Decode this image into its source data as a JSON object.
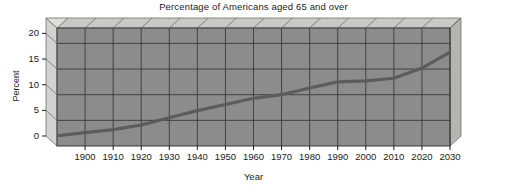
{
  "chart_data": {
    "type": "line",
    "title": "Percentage of Americans aged 65 and over",
    "xlabel": "Year",
    "ylabel": "Percent",
    "xlim": [
      1890,
      2030
    ],
    "ylim": [
      0,
      23
    ],
    "ytick_labels": [
      "0",
      "5",
      "10",
      "15",
      "20"
    ],
    "ytick_values": [
      0,
      5,
      10,
      15,
      20
    ],
    "xtick_labels": [
      "1900",
      "1910",
      "1920",
      "1930",
      "1940",
      "1950",
      "1960",
      "1970",
      "1980",
      "1990",
      "2000",
      "2010",
      "2020",
      "2030"
    ],
    "xtick_values": [
      1900,
      1910,
      1920,
      1930,
      1940,
      1950,
      1960,
      1970,
      1980,
      1990,
      2000,
      2010,
      2020,
      2030
    ],
    "grid": true,
    "legend": "none",
    "series": [
      {
        "name": "Percent aged 65 and over",
        "x": [
          1890,
          1900,
          1910,
          1920,
          1930,
          1940,
          1950,
          1960,
          1970,
          1980,
          1990,
          2000,
          2010,
          2020,
          2030
        ],
        "values": [
          2.0,
          2.6,
          3.2,
          4.1,
          5.5,
          6.9,
          8.1,
          9.3,
          10.0,
          11.3,
          12.5,
          12.7,
          13.2,
          15.2,
          18.3
        ]
      }
    ],
    "colors": {
      "plot_background": "#8c8c8c",
      "plot_top_face": "#c9c9c5",
      "plot_side_face": "#b4b4b0",
      "gridline": "#3a3a3a",
      "line": "#5c5c5c",
      "axis_text": "#1a1a1a",
      "page_background": "#ffffff"
    }
  }
}
